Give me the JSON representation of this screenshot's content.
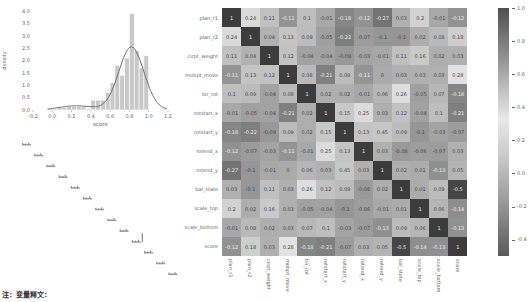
{
  "chart_data": [
    {
      "type": "bar",
      "subtype": "histogram_with_kde",
      "title": "",
      "xlabel": "score",
      "ylabel": "density",
      "xlim": [
        -0.2,
        1.2
      ],
      "ylim": [
        0,
        4.0
      ],
      "x_ticks": [
        "-0.2",
        "0.0",
        "0.2",
        "0.4",
        "0.6",
        "0.8",
        "1.0",
        "1.2"
      ],
      "y_ticks": [
        "0.0",
        "0.5",
        "1.0",
        "1.5",
        "2.0",
        "2.5",
        "3.0",
        "3.5",
        "4.0"
      ],
      "bins": [
        {
          "x0": -0.05,
          "x1": 0.0,
          "density": 0.05
        },
        {
          "x0": 0.0,
          "x1": 0.05,
          "density": 0.05
        },
        {
          "x0": 0.05,
          "x1": 0.1,
          "density": 0.1
        },
        {
          "x0": 0.1,
          "x1": 0.15,
          "density": 0.1
        },
        {
          "x0": 0.15,
          "x1": 0.2,
          "density": 0.15
        },
        {
          "x0": 0.2,
          "x1": 0.25,
          "density": 0.15
        },
        {
          "x0": 0.25,
          "x1": 0.3,
          "density": 0.15
        },
        {
          "x0": 0.3,
          "x1": 0.35,
          "density": 0.15
        },
        {
          "x0": 0.35,
          "x1": 0.4,
          "density": 0.05
        },
        {
          "x0": 0.4,
          "x1": 0.45,
          "density": 0.4
        },
        {
          "x0": 0.45,
          "x1": 0.5,
          "density": 0.4
        },
        {
          "x0": 0.5,
          "x1": 0.55,
          "density": 0.4
        },
        {
          "x0": 0.55,
          "x1": 0.6,
          "density": 0.7
        },
        {
          "x0": 0.6,
          "x1": 0.65,
          "density": 1.1
        },
        {
          "x0": 0.65,
          "x1": 0.7,
          "density": 1.8
        },
        {
          "x0": 0.7,
          "x1": 0.75,
          "density": 1.4
        },
        {
          "x0": 0.75,
          "x1": 0.8,
          "density": 2.1
        },
        {
          "x0": 0.8,
          "x1": 0.85,
          "density": 3.9
        },
        {
          "x0": 0.85,
          "x1": 0.9,
          "density": 2.4
        },
        {
          "x0": 0.9,
          "x1": 0.95,
          "density": 1.7
        },
        {
          "x0": 0.95,
          "x1": 1.0,
          "density": 2.2
        }
      ],
      "kde_peak": {
        "x": 0.82,
        "density": 2.65
      },
      "grid": false
    },
    {
      "type": "heatmap",
      "title": "",
      "labels": [
        "plan_r1",
        "plan_r2",
        "cirpt_weight",
        "mobpt_move",
        "bir_rot",
        "rotstart_x",
        "rotstart_y",
        "rotend_x",
        "rotend_y",
        "bal_state",
        "scale_top",
        "scale_bottom",
        "score"
      ],
      "matrix": [
        [
          1,
          0.24,
          0.11,
          -0.11,
          0.1,
          -0.01,
          -0.18,
          -0.12,
          -0.27,
          0.03,
          0.2,
          -0.01,
          -0.12
        ],
        [
          0.24,
          1,
          0.04,
          0.13,
          0.09,
          -0.05,
          -0.22,
          -0.07,
          -0.1,
          -0.1,
          0.02,
          0.08,
          0.18
        ],
        [
          0.11,
          0.04,
          1,
          0.12,
          -0.04,
          -0.04,
          -0.09,
          -0.03,
          -0.01,
          0.11,
          0.16,
          0.02,
          0.03
        ],
        [
          -0.11,
          0.13,
          0.12,
          1,
          0.08,
          -0.21,
          0.09,
          -0.11,
          0,
          0.03,
          0.03,
          0.03,
          0.28
        ],
        [
          0.1,
          0.09,
          -0.04,
          0.08,
          1,
          0.02,
          0.02,
          -0.01,
          0.06,
          0.26,
          -0.05,
          0.07,
          -0.18
        ],
        [
          -0.01,
          -0.05,
          -0.04,
          -0.21,
          0.02,
          1,
          0.15,
          0.25,
          0.03,
          0.12,
          -0.04,
          0.1,
          -0.21
        ],
        [
          -0.18,
          -0.22,
          -0.09,
          0.09,
          0.02,
          0.15,
          1,
          0.13,
          0.45,
          0.09,
          -0.1,
          -0.03,
          -0.07
        ],
        [
          -0.12,
          -0.07,
          -0.03,
          -0.11,
          -0.01,
          0.25,
          0.13,
          1,
          0.03,
          -0.08,
          -0.06,
          -0.07,
          0.03
        ],
        [
          -0.27,
          -0.1,
          -0.01,
          0,
          0.06,
          0.03,
          0.45,
          0.03,
          1,
          0.02,
          0.01,
          -0.13,
          0.05
        ],
        [
          0.03,
          -0.1,
          0.11,
          0.03,
          0.26,
          0.12,
          0.09,
          -0.08,
          0.02,
          1,
          0.01,
          0.09,
          -0.5
        ],
        [
          0.2,
          0.02,
          0.16,
          0.03,
          -0.05,
          -0.04,
          -0.1,
          -0.06,
          -0.01,
          0.01,
          1,
          0.06,
          -0.14
        ],
        [
          -0.01,
          0.08,
          0.02,
          0.03,
          0.07,
          0.1,
          -0.03,
          -0.07,
          -0.13,
          0.09,
          0.06,
          1,
          -0.13
        ],
        [
          -0.12,
          0.18,
          0.03,
          0.28,
          -0.18,
          -0.21,
          -0.07,
          0.03,
          0.05,
          -0.5,
          -0.14,
          -0.13,
          1
        ]
      ],
      "colorbar": {
        "range": [
          -0.5,
          1.0
        ],
        "ticks": [
          "1.0",
          "0.8",
          "0.6",
          "0.4",
          "0.2",
          "0.0",
          "-0.2",
          "-0.4"
        ]
      },
      "annotated": true
    }
  ],
  "hist": {
    "xlabel": "score",
    "ylabel": "density",
    "x_ticks": [
      "-0.2",
      "0.0",
      "0.2",
      "0.4",
      "0.6",
      "0.8",
      "1.0",
      "1.2"
    ],
    "y_ticks": [
      "0.0",
      "0.5",
      "1.0",
      "1.5",
      "2.0",
      "2.5",
      "3.0",
      "3.5",
      "4.0"
    ]
  },
  "colors": {
    "bar_fill": "#c8c8c8",
    "bar_edge": "#ffffff",
    "kde_line": "#6e6e6e",
    "diag_cell": "#3c3c3c",
    "text_dark": "#333333"
  },
  "footnote": "注：变量释文："
}
